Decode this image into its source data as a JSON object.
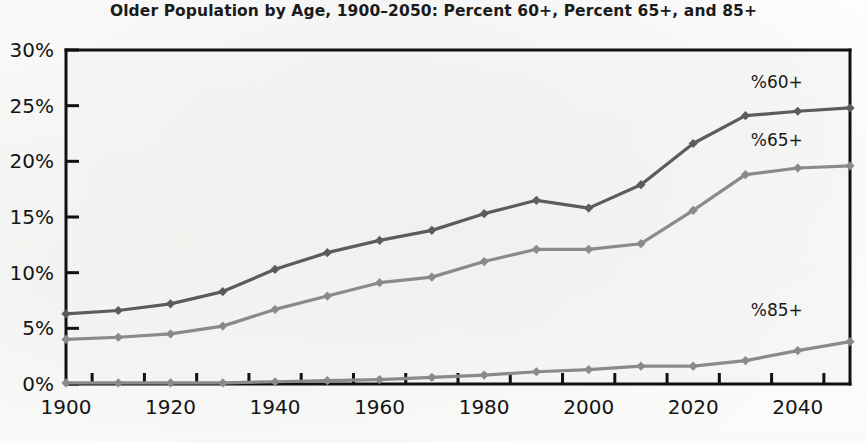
{
  "chart_data": {
    "type": "line",
    "title": "Older Population by Age, 1900–2050: Percent 60+, Percent 65+, and 85+",
    "xlabel": "",
    "ylabel": "",
    "x": [
      1900,
      1910,
      1920,
      1930,
      1940,
      1950,
      1960,
      1970,
      1980,
      1990,
      2000,
      2010,
      2020,
      2030,
      2040,
      2050
    ],
    "xlim": [
      1900,
      2050
    ],
    "ylim": [
      0,
      30
    ],
    "xticks": [
      1900,
      1920,
      1940,
      1960,
      1980,
      2000,
      2020,
      2040
    ],
    "xticklabels": [
      "1900",
      "1920",
      "1940",
      "1960",
      "1980",
      "2000",
      "2020",
      "2040"
    ],
    "yticks": [
      0,
      5,
      10,
      15,
      20,
      25,
      30
    ],
    "yticklabels": [
      "0%",
      "5%",
      "10%",
      "15%",
      "20%",
      "25%",
      "30%"
    ],
    "grid": false,
    "legend_position": "inline-right",
    "series": [
      {
        "name": "%60+",
        "label": "%60+",
        "color": "#5c5c5c",
        "values": [
          6.3,
          6.6,
          7.2,
          8.3,
          10.3,
          11.8,
          12.9,
          13.8,
          15.3,
          16.5,
          15.8,
          17.9,
          21.6,
          24.1,
          24.5,
          24.8
        ]
      },
      {
        "name": "%65+",
        "label": "%65+",
        "color": "#8a8a8a",
        "values": [
          4.0,
          4.2,
          4.5,
          5.2,
          6.7,
          7.9,
          9.1,
          9.6,
          11.0,
          12.1,
          12.1,
          12.6,
          15.6,
          18.8,
          19.4,
          19.6
        ]
      },
      {
        "name": "%85+",
        "label": "%85+",
        "color": "#8a8a8a",
        "values": [
          0.1,
          0.1,
          0.1,
          0.1,
          0.2,
          0.3,
          0.4,
          0.6,
          0.8,
          1.1,
          1.3,
          1.6,
          1.6,
          2.1,
          3.0,
          3.8
        ]
      }
    ],
    "annotations": [
      {
        "text": "%60+",
        "x": 2036,
        "y": 26.6
      },
      {
        "text": "%65+",
        "x": 2036,
        "y": 21.4
      },
      {
        "text": "%85+",
        "x": 2036,
        "y": 6.1
      }
    ]
  }
}
